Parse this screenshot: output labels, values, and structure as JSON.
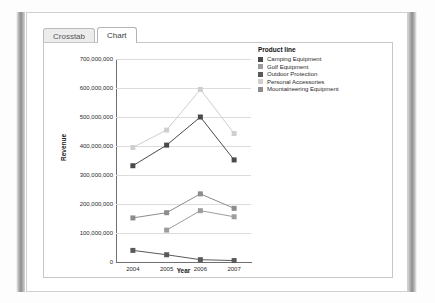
{
  "window": {
    "tabs": [
      {
        "label": "Crosstab",
        "active": false
      },
      {
        "label": "Chart",
        "active": true
      }
    ]
  },
  "legend": {
    "title": "Product line",
    "items": [
      {
        "label": "Camping Equipment",
        "color": "#4a4a4a"
      },
      {
        "label": "Golf Equipment",
        "color": "#9d9d9d"
      },
      {
        "label": "Outdoor Protection",
        "color": "#5a5a5a"
      },
      {
        "label": "Personal Accessories",
        "color": "#cfcfcf"
      },
      {
        "label": "Mountaineering Equipment",
        "color": "#8c8c8c"
      }
    ]
  },
  "chart_data": {
    "type": "line",
    "title": "",
    "xlabel": "Year",
    "ylabel": "Revenue",
    "categories": [
      "2004",
      "2005",
      "2006",
      "2007"
    ],
    "ylim": [
      0,
      700000000
    ],
    "yticks": [
      0,
      100000000,
      200000000,
      300000000,
      400000000,
      500000000,
      600000000,
      700000000
    ],
    "ytick_labels": [
      "0",
      "100,000,000",
      "200,000,000",
      "300,000,000",
      "400,000,000",
      "500,000,000",
      "600,000,000",
      "700,000,000"
    ],
    "grid": true,
    "legend_position": "right",
    "series": [
      {
        "name": "Camping Equipment",
        "color": "#4a4a4a",
        "values": [
          332000000,
          403000000,
          500000000,
          352000000
        ]
      },
      {
        "name": "Golf Equipment",
        "color": "#9d9d9d",
        "values": [
          null,
          110000000,
          177000000,
          156000000
        ]
      },
      {
        "name": "Outdoor Protection",
        "color": "#5a5a5a",
        "values": [
          40000000,
          25000000,
          8000000,
          5000000
        ]
      },
      {
        "name": "Personal Accessories",
        "color": "#cfcfcf",
        "values": [
          395000000,
          455000000,
          595000000,
          443000000
        ]
      },
      {
        "name": "Mountaineering Equipment",
        "color": "#8c8c8c",
        "values": [
          152000000,
          170000000,
          235000000,
          185000000
        ]
      }
    ]
  }
}
